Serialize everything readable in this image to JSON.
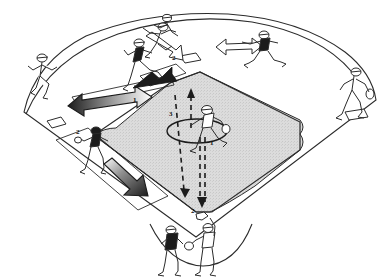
{
  "diagram": {
    "kind": "baseball-field-play-diagram",
    "colors": {
      "ink": "#1a1a1a",
      "line": "#2b2b2b",
      "infield_fill": "#d9d9d9",
      "outfield_fill": "#ffffff",
      "arrow_solid": "#1c1c1c",
      "arrow_gradient_light": "#9a9a9a",
      "page_background": "#ffffff"
    },
    "field": {
      "grass_label": "",
      "infield_shaded": true,
      "bases": [
        {
          "name": "home-plate",
          "label": ""
        },
        {
          "name": "first-base",
          "label": ""
        },
        {
          "name": "second-base",
          "label": ""
        },
        {
          "name": "third-base",
          "label": ""
        }
      ],
      "pitchers_mound": {
        "name": "pitchers-mound",
        "label": ""
      }
    },
    "sequence_labels": [
      {
        "id": "lbl-1-mound",
        "text": "1",
        "role": "pitcher-throw-step",
        "x": 210,
        "y": 142
      },
      {
        "id": "lbl-2-second",
        "text": "2",
        "role": "runner-to-second-step",
        "x": 172,
        "y": 58
      },
      {
        "id": "lbl-2-third",
        "text": "2",
        "role": "runner-to-third-step",
        "x": 78,
        "y": 133
      },
      {
        "id": "lbl-2-home",
        "text": "2",
        "role": "throw-to-home-step",
        "x": 192,
        "y": 212
      },
      {
        "id": "lbl-3-center",
        "text": "3",
        "role": "return-throw-step",
        "x": 170,
        "y": 114
      },
      {
        "id": "lbl-1-left",
        "text": "1",
        "role": "lead-runner-step",
        "x": 134,
        "y": 100
      }
    ],
    "players": [
      {
        "id": "player-left-fielder",
        "name": "left-fielder",
        "label": ""
      },
      {
        "id": "player-center-left",
        "name": "center-left-fielder",
        "label": ""
      },
      {
        "id": "player-center-runner",
        "name": "center-runner",
        "label": ""
      },
      {
        "id": "player-center-right",
        "name": "center-right-fielder",
        "label": ""
      },
      {
        "id": "player-right-fielder",
        "name": "right-fielder",
        "label": ""
      },
      {
        "id": "player-third-baseman",
        "name": "third-baseman",
        "label": ""
      },
      {
        "id": "player-pitcher",
        "name": "pitcher",
        "label": ""
      },
      {
        "id": "player-batter",
        "name": "batter",
        "label": ""
      },
      {
        "id": "player-catcher",
        "name": "catcher",
        "label": ""
      }
    ],
    "arrows": [
      {
        "id": "arrow-outfield-left",
        "name": "arrow-outfield-left",
        "style": "solid-gradient",
        "direction": "left"
      },
      {
        "id": "arrow-second-base",
        "name": "arrow-to-second-base",
        "style": "solid",
        "direction": "down-left"
      },
      {
        "id": "arrow-center-right-outline",
        "name": "arrow-center-right-outline",
        "style": "outline",
        "direction": "left"
      },
      {
        "id": "arrow-second-outline",
        "name": "arrow-to-second-outline",
        "style": "outline",
        "direction": "right"
      },
      {
        "id": "arrow-third-base-line",
        "name": "arrow-down-third-base-line",
        "style": "solid-gradient",
        "direction": "down-left"
      },
      {
        "id": "arrow-dashed-up",
        "name": "dashed-arrow-up-center",
        "style": "dashed",
        "direction": "up"
      },
      {
        "id": "arrow-dashed-down-left",
        "name": "dashed-arrow-down-left",
        "style": "dashed",
        "direction": "down"
      },
      {
        "id": "arrow-dashed-down-home",
        "name": "dashed-arrow-down-to-home",
        "style": "dashed",
        "direction": "down"
      }
    ]
  }
}
